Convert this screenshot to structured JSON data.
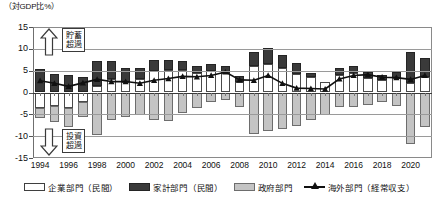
{
  "axis_unit_title": "（対GDP比%）",
  "annotations": {
    "top": {
      "line1": "貯蓄",
      "line2": "超過"
    },
    "bottom": {
      "line1": "投資",
      "line2": "超過"
    }
  },
  "legend": [
    {
      "key": "corporate",
      "label": "企業部門（民間）",
      "swatch": "corp"
    },
    {
      "key": "household",
      "label": "家計部門（民間）",
      "swatch": "house"
    },
    {
      "key": "government",
      "label": "政府部門",
      "swatch": "govt"
    },
    {
      "key": "overseas",
      "label": "海外部門（経常収支）",
      "swatch": "line"
    }
  ],
  "chart_data": {
    "type": "bar",
    "title": "",
    "subtitle": "",
    "xlabel": "",
    "ylabel": "（対GDP比%）",
    "ylim": [
      -15,
      15
    ],
    "yticks": [
      15,
      10,
      5,
      0,
      -5,
      -10,
      -15
    ],
    "ytick_labels": [
      "15",
      "10",
      "5",
      "0",
      "-5",
      "-10",
      "-15"
    ],
    "grid": true,
    "stacked": true,
    "legend_position": "bottom",
    "x": [
      1994,
      1995,
      1996,
      1997,
      1998,
      1999,
      2000,
      2001,
      2002,
      2003,
      2004,
      2005,
      2006,
      2007,
      2008,
      2009,
      2010,
      2011,
      2012,
      2013,
      2014,
      2015,
      2016,
      2017,
      2018,
      2019,
      2020,
      2021
    ],
    "xtick_labels": [
      "1994",
      "1996",
      "1998",
      "2000",
      "2002",
      "2004",
      "2006",
      "2008",
      "2010",
      "2012",
      "2014",
      "2016",
      "2018",
      "2020"
    ],
    "xticks": [
      1994,
      1996,
      1998,
      2000,
      2002,
      2004,
      2006,
      2008,
      2010,
      2012,
      2014,
      2016,
      2018,
      2020
    ],
    "series": [
      {
        "name": "企業部門（民間）",
        "key": "corporate",
        "color": "#ffffff",
        "edge": "#4a4a4a",
        "values": [
          -3.5,
          -3.2,
          -3.5,
          -2.2,
          1.6,
          3.0,
          2.3,
          3.1,
          4.9,
          5.2,
          5.2,
          4.4,
          4.9,
          4.5,
          2.5,
          6.0,
          6.6,
          5.6,
          4.3,
          3.5,
          2.3,
          4.0,
          4.4,
          3.3,
          2.9,
          3.3,
          2.2,
          3.6
        ]
      },
      {
        "name": "家計部門（民間）",
        "key": "household",
        "color": "#3a3a3a",
        "edge": "#242424",
        "values": [
          5.3,
          4.2,
          4.0,
          3.6,
          5.5,
          4.3,
          3.2,
          2.5,
          2.6,
          2.2,
          2.0,
          1.6,
          1.7,
          1.6,
          1.3,
          3.3,
          3.5,
          2.9,
          2.4,
          1.0,
          -0.1,
          1.5,
          1.7,
          1.3,
          1.0,
          1.5,
          7.0,
          4.4
        ]
      },
      {
        "name": "政府部門",
        "key": "government",
        "color": "#c4c4c4",
        "edge": "#6d6d6d",
        "values": [
          -2.3,
          -3.6,
          -4.3,
          -3.3,
          -9.8,
          -6.4,
          -5.7,
          -5.2,
          -6.4,
          -6.5,
          -4.8,
          -3.6,
          -2.1,
          -1.8,
          -3.3,
          -9.4,
          -8.8,
          -8.4,
          -7.7,
          -6.3,
          -5.0,
          -3.4,
          -3.4,
          -2.9,
          -2.2,
          -3.0,
          -11.7,
          -8.0
        ]
      }
    ],
    "line_series": {
      "name": "海外部門（経常収支）",
      "key": "overseas",
      "color": "#111111",
      "marker": "triangle",
      "values": [
        2.7,
        2.1,
        1.4,
        2.2,
        3.0,
        2.5,
        2.5,
        2.1,
        2.8,
        3.2,
        3.7,
        3.6,
        3.9,
        4.7,
        2.9,
        2.8,
        3.9,
        2.1,
        1.0,
        0.9,
        0.8,
        3.1,
        3.9,
        4.1,
        3.5,
        3.4,
        3.0,
        3.9
      ]
    }
  }
}
